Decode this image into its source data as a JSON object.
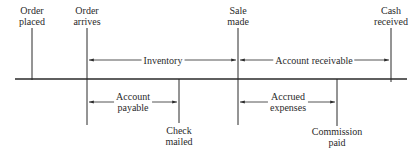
{
  "diagram": {
    "type": "timeline",
    "events_top": [
      {
        "id": "order-placed",
        "line1": "Order",
        "line2": "placed",
        "x": 32
      },
      {
        "id": "order-arrives",
        "line1": "Order",
        "line2": "arrives",
        "x": 87
      },
      {
        "id": "sale-made",
        "line1": "Sale",
        "line2": "made",
        "x": 238
      },
      {
        "id": "cash-received",
        "line1": "Cash",
        "line2": "received",
        "x": 391
      }
    ],
    "events_bottom": [
      {
        "id": "check-mailed",
        "line1": "Check",
        "line2": "mailed",
        "x": 179
      },
      {
        "id": "commission-paid",
        "line1": "Commission",
        "line2": "paid",
        "x": 337
      }
    ],
    "spans_top": [
      {
        "id": "inventory",
        "label": "Inventory",
        "from": "Order arrives",
        "to": "Sale made"
      },
      {
        "id": "account-receivable",
        "label": "Account receivable",
        "from": "Sale made",
        "to": "Cash received"
      }
    ],
    "spans_bottom": [
      {
        "id": "account-payable",
        "line1": "Account",
        "line2": "payable",
        "from": "Order arrives",
        "to": "Check mailed"
      },
      {
        "id": "accrued-expenses",
        "line1": "Accrued",
        "line2": "expenses",
        "from": "Sale made",
        "to": "Commission paid"
      }
    ],
    "colors": {
      "ink": "#2a2a2a",
      "background": "#ffffff"
    }
  }
}
